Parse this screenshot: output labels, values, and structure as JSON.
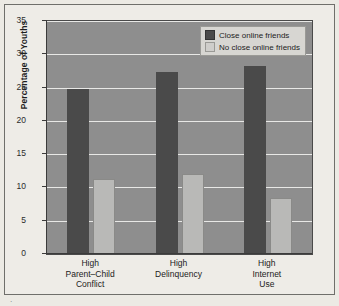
{
  "chart_data": {
    "type": "bar",
    "title": "",
    "xlabel": "",
    "ylabel": "Percentage of Youths",
    "ylim": [
      0,
      35
    ],
    "ytick_values": [
      0,
      5,
      10,
      15,
      20,
      25,
      30,
      35
    ],
    "ytick_labels": [
      "0",
      "5",
      "10",
      "15",
      "20",
      "25",
      "30",
      "35"
    ],
    "grid": true,
    "grid_axis": "y",
    "legend_position": "top-right-inside",
    "categories": [
      "High Parent–Child Conflict",
      "High Delinquency",
      "High Internet Use"
    ],
    "category_lines": [
      [
        "High",
        "Parent–Child",
        "Conflict"
      ],
      [
        "High",
        "Delinquency"
      ],
      [
        "High",
        "Internet",
        "Use"
      ]
    ],
    "series": [
      {
        "name": "Close online friends",
        "values": [
          24.8,
          27.3,
          28.3
        ],
        "color": "#4a4a4a"
      },
      {
        "name": "No close online friends",
        "values": [
          11.3,
          12.0,
          8.4
        ],
        "color": "#b9b9b7"
      }
    ]
  },
  "legend": {
    "entries": [
      {
        "label": "Close online friends",
        "swatch": "dark"
      },
      {
        "label": "No close online friends",
        "swatch": "light"
      }
    ]
  },
  "colors": {
    "page_background": "#eceae4",
    "plot_background": "#8e8e8e",
    "gridline": "#e8e8e6",
    "axis": "#3b3b3b",
    "bar_dark": "#4a4a4a",
    "bar_light": "#b9b9b7",
    "legend_background": "#d7d6d2",
    "text": "#1d1d1d"
  },
  "scan_mark": "·"
}
